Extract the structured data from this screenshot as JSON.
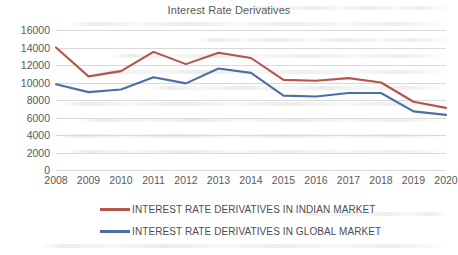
{
  "chart_data": {
    "type": "line",
    "title": "Interest Rate Derivatives",
    "xlabel": "",
    "ylabel": "",
    "x": [
      2008,
      2009,
      2010,
      2011,
      2012,
      2013,
      2014,
      2015,
      2016,
      2017,
      2018,
      2019,
      2020
    ],
    "categories": [
      "2008",
      "2009",
      "2010",
      "2011",
      "2012",
      "2013",
      "2014",
      "2015",
      "2016",
      "2017",
      "2018",
      "2019",
      "2020"
    ],
    "ylim": [
      0,
      16000
    ],
    "ytick_values": [
      0,
      2000,
      4000,
      6000,
      8000,
      10000,
      12000,
      14000,
      16000
    ],
    "ytick_labels": [
      "0",
      "2000",
      "4000",
      "6000",
      "8000",
      "10000",
      "12000",
      "14000",
      "16000"
    ],
    "grid": true,
    "legend_position": "bottom",
    "series": [
      {
        "name": "INTEREST RATE DERIVATIVES IN INDIAN MARKET",
        "color": "#b5554a",
        "values": [
          14000,
          10700,
          11300,
          13500,
          12100,
          13400,
          12800,
          10300,
          10200,
          10500,
          10000,
          7800,
          7100
        ]
      },
      {
        "name": "INTEREST RATE DERIVATIVES IN GLOBAL MARKET",
        "color": "#4a6fa5",
        "values": [
          9800,
          8900,
          9200,
          10600,
          9900,
          11600,
          11100,
          8500,
          8400,
          8800,
          8800,
          6700,
          6300
        ]
      }
    ]
  },
  "legend": {
    "items": [
      {
        "label": "INTEREST RATE DERIVATIVES IN INDIAN MARKET",
        "color": "#b5554a"
      },
      {
        "label": "INTEREST RATE DERIVATIVES IN GLOBAL MARKET",
        "color": "#4a6fa5"
      }
    ]
  }
}
